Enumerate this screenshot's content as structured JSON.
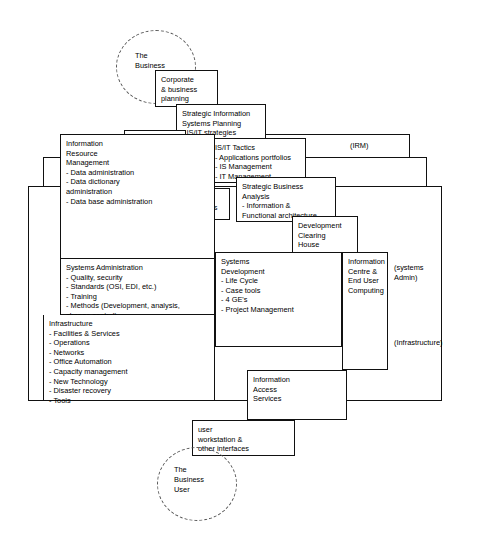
{
  "diagram": {
    "entities": {
      "business_ellipse": "The\nBusiness",
      "business_user_ellipse": "The\nBusiness\nUser"
    },
    "boxes": {
      "corporate_planning": "Corporate\n& business\nplanning",
      "sisp": "Strategic Information\nSystems Planning\n- IS/IT strategies",
      "isit_aims": "IS/IT\nAims",
      "isit_policies": "IS/IT\nPolicies",
      "isit_objectives": "IS/IT\nObjectives",
      "isit_tactics": "IS/IT Tactics\n- Applications portfolios\n- IS Management\n- IT Management",
      "strategic_business_analysis": "Strategic Business\nAnalysis\n- Information &\n  Functional architecture",
      "development_clearing_house": "Development\nClearing\nHouse",
      "information_resource_management": "Information\nResource\nManagement\n- Data administration\n- Data dictionary\n  administration\n- Data base administration",
      "systems_administration": "Systems Administration\n- Quality, security\n- Standards (OSI, EDI, etc.)\n- Training\n- Methods (Development, analysis,\n  change control)",
      "infrastructure": "Infrastructure\n- Facilities & Services\n- Operations\n- Networks\n- Office Automation\n- Capacity management\n- New Technology\n- Disaster recovery\n- Tools",
      "systems_development": "Systems\nDevelopment\n- Life Cycle\n- Case tools\n- 4 GE's\n- Project Management",
      "information_centre": "Information\nCentre &\nEnd User\nComputing",
      "information_access_services": "Information\nAccess\nServices",
      "user_workstation": "user\nworkstation &\nother interfaces"
    },
    "annotations": {
      "irm": "(IRM)",
      "systems_admin": "(systems\nAdmin)",
      "infrastructure_tag": "(Infrastructure)"
    },
    "colors": {
      "line": "#111111",
      "text": "#000000",
      "background": "#ffffff",
      "ellipse_border": "#555555"
    }
  }
}
